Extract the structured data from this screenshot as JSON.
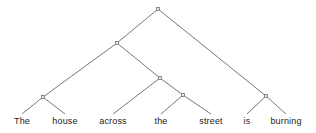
{
  "figure": {
    "kind": "constituency-syntax-tree",
    "sentence": "The house across the street is burning",
    "background_color": "#ffffff",
    "line_color": "#555555",
    "node_marker_color": "#666666",
    "node_marker_fill": "#e8e8e8",
    "text_color": "#1b1b1b"
  },
  "leaves": [
    {
      "id": "leaf-the-1",
      "label": "The",
      "x": 22,
      "y": 124
    },
    {
      "id": "leaf-house",
      "label": "house",
      "x": 65,
      "y": 124
    },
    {
      "id": "leaf-across",
      "label": "across",
      "x": 113,
      "y": 124
    },
    {
      "id": "leaf-the-2",
      "label": "the",
      "x": 161,
      "y": 124
    },
    {
      "id": "leaf-street",
      "label": "street",
      "x": 211,
      "y": 124
    },
    {
      "id": "leaf-is",
      "label": "is",
      "x": 247,
      "y": 124
    },
    {
      "id": "leaf-burning",
      "label": "burning",
      "x": 286,
      "y": 124
    }
  ],
  "nodes": [
    {
      "id": "node-root",
      "x": 158,
      "y": 9
    },
    {
      "id": "node-subject-np",
      "x": 117,
      "y": 43
    },
    {
      "id": "node-pp",
      "x": 160,
      "y": 78
    },
    {
      "id": "node-det-np",
      "x": 43,
      "y": 97
    },
    {
      "id": "node-object-np",
      "x": 183,
      "y": 95
    },
    {
      "id": "node-vp",
      "x": 266,
      "y": 96
    }
  ],
  "edges": [
    {
      "id": "edge-root-to-subject-np",
      "x1": 158,
      "y1": 9,
      "x2": 117,
      "y2": 43
    },
    {
      "id": "edge-root-to-vp",
      "x1": 158,
      "y1": 9,
      "x2": 266,
      "y2": 96
    },
    {
      "id": "edge-subject-np-to-det-np",
      "x1": 117,
      "y1": 43,
      "x2": 43,
      "y2": 97
    },
    {
      "id": "edge-subject-np-to-pp",
      "x1": 117,
      "y1": 43,
      "x2": 160,
      "y2": 78
    },
    {
      "id": "edge-det-np-to-the-1",
      "x1": 43,
      "y1": 97,
      "x2": 22,
      "y2": 114
    },
    {
      "id": "edge-det-np-to-house",
      "x1": 43,
      "y1": 97,
      "x2": 65,
      "y2": 114
    },
    {
      "id": "edge-pp-to-across",
      "x1": 160,
      "y1": 78,
      "x2": 113,
      "y2": 114
    },
    {
      "id": "edge-pp-to-object-np",
      "x1": 160,
      "y1": 78,
      "x2": 183,
      "y2": 95
    },
    {
      "id": "edge-object-np-to-the-2",
      "x1": 183,
      "y1": 95,
      "x2": 161,
      "y2": 114
    },
    {
      "id": "edge-object-np-to-street",
      "x1": 183,
      "y1": 95,
      "x2": 211,
      "y2": 114
    },
    {
      "id": "edge-vp-to-is",
      "x1": 266,
      "y1": 96,
      "x2": 247,
      "y2": 114
    },
    {
      "id": "edge-vp-to-burning",
      "x1": 266,
      "y1": 96,
      "x2": 286,
      "y2": 114
    }
  ]
}
